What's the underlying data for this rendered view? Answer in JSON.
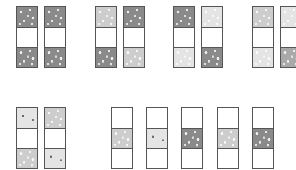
{
  "figure": {
    "groups": [
      {
        "id": "group-1",
        "strips": [
          {
            "x": 16,
            "y": 6,
            "cells": [
              "dark",
              "blank",
              "dark"
            ]
          },
          {
            "x": 44,
            "y": 6,
            "cells": [
              "dark",
              "blank",
              "dark"
            ]
          }
        ]
      },
      {
        "id": "group-2",
        "strips": [
          {
            "x": 95,
            "y": 6,
            "cells": [
              "light",
              "blank",
              "dark"
            ]
          },
          {
            "x": 123,
            "y": 6,
            "cells": [
              "dark",
              "blank",
              "light"
            ]
          }
        ]
      },
      {
        "id": "group-3",
        "strips": [
          {
            "x": 173,
            "y": 6,
            "cells": [
              "dark",
              "blank",
              "pale"
            ]
          },
          {
            "x": 201,
            "y": 6,
            "cells": [
              "pale",
              "blank",
              "dark"
            ]
          }
        ]
      },
      {
        "id": "group-4",
        "strips": [
          {
            "x": 252,
            "y": 6,
            "cells": [
              "light",
              "blank",
              "pale"
            ]
          },
          {
            "x": 280,
            "y": 6,
            "cells": [
              "pale",
              "blank",
              "mid"
            ]
          }
        ]
      },
      {
        "id": "group-5",
        "strips": [
          {
            "x": 16,
            "y": 107,
            "cells": [
              "pale-dots",
              "blank",
              "light"
            ]
          },
          {
            "x": 44,
            "y": 107,
            "cells": [
              "light",
              "blank",
              "pale-dots"
            ]
          }
        ]
      },
      {
        "id": "group-6",
        "strips": [
          {
            "x": 111,
            "y": 107,
            "cells": [
              "blank",
              "light",
              "blank"
            ]
          },
          {
            "x": 146,
            "y": 107,
            "cells": [
              "blank",
              "pale-dots",
              "blank"
            ]
          },
          {
            "x": 181,
            "y": 107,
            "cells": [
              "blank",
              "dark",
              "blank"
            ]
          },
          {
            "x": 217,
            "y": 107,
            "cells": [
              "blank",
              "light",
              "blank"
            ]
          },
          {
            "x": 252,
            "y": 107,
            "cells": [
              "blank",
              "dark",
              "blank"
            ]
          }
        ]
      }
    ],
    "colors": {
      "border": "#555555",
      "dark": "#8a8a8a",
      "mid": "#a9a9a9",
      "light": "#cdcdcd",
      "pale": "#e4e4e4",
      "blank": "#ffffff"
    }
  }
}
